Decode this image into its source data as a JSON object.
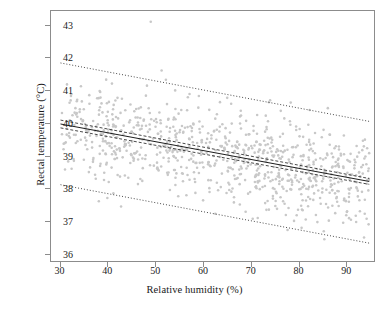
{
  "figure": {
    "type": "scatter-with-regression",
    "caption_partial": ""
  },
  "axes": {
    "x": {
      "label": "Relative humidity (%)",
      "ticks": [
        30,
        40,
        50,
        60,
        70,
        80,
        90
      ],
      "tick_labels": [
        "30",
        "40",
        "50",
        "60",
        "70",
        "80",
        "90"
      ],
      "range": [
        28.0,
        96.0
      ]
    },
    "y": {
      "label": "Rectal temperature (°C)",
      "ticks": [
        36,
        37,
        38,
        39,
        40,
        41,
        42,
        43
      ],
      "tick_labels": [
        "36",
        "37",
        "38",
        "39",
        "40",
        "41",
        "42",
        "43"
      ],
      "range": [
        35.75,
        43.45
      ]
    }
  },
  "chart_data": {
    "type": "scatter",
    "title": "",
    "xlabel": "Relative humidity (%)",
    "ylabel": "Rectal temperature (°C)",
    "xlim": [
      28.0,
      96.0
    ],
    "ylim": [
      35.75,
      43.45
    ],
    "grid": false,
    "legend": "none",
    "point_color": "#c8c8c8",
    "point_size": 2.6,
    "n_points": 900,
    "series": [
      {
        "name": "Observations",
        "marker": "circle",
        "color": "#c8c8c8",
        "x_range": [
          30,
          95
        ],
        "y_mean_at_x30": 39.95,
        "y_mean_at_x95": 38.2,
        "residual_sd": 0.72
      }
    ],
    "annotations": [
      {
        "name": "outlier-high",
        "x": 49,
        "y": 43.12
      }
    ],
    "lines": [
      {
        "name": "regression-line",
        "style": "solid",
        "color": "#1a1a1a",
        "width": 1.0,
        "x": [
          30,
          95
        ],
        "y": [
          39.97,
          38.2
        ],
        "slope": -0.0272,
        "intercept": 40.79
      },
      {
        "name": "confidence-band-upper",
        "style": "dashed",
        "color": "#1a1a1a",
        "width": 0.8,
        "x": [
          30,
          95
        ],
        "y": [
          40.09,
          38.29
        ]
      },
      {
        "name": "confidence-band-lower",
        "style": "dashed",
        "color": "#1a1a1a",
        "width": 0.8,
        "x": [
          30,
          95
        ],
        "y": [
          39.85,
          38.11
        ]
      },
      {
        "name": "prediction-band-upper",
        "style": "dotted",
        "color": "#1a1a1a",
        "width": 0.8,
        "x": [
          30,
          95
        ],
        "y": [
          41.85,
          40.05
        ]
      },
      {
        "name": "prediction-band-lower",
        "style": "dotted",
        "color": "#1a1a1a",
        "width": 0.8,
        "x": [
          30,
          95
        ],
        "y": [
          38.1,
          36.3
        ]
      }
    ]
  },
  "colors": {
    "points": "#c8c8c8",
    "frame": "#8c8c8c",
    "lines": "#1a1a1a",
    "background": "#ffffff"
  }
}
